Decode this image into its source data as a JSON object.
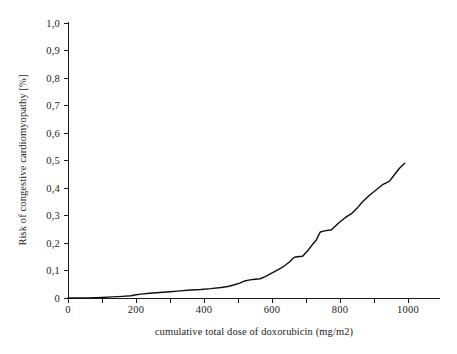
{
  "chart_data": {
    "type": "line",
    "title": "",
    "xlabel": "cumulative total dose of doxorubicin (mg/m2)",
    "ylabel": "Risk of congestive cardiomyopathy [%]",
    "xlim": [
      0,
      1060
    ],
    "ylim": [
      0,
      1.0
    ],
    "grid": false,
    "legend": null,
    "decimal_separator": ",",
    "x_tick_labels": [
      "0",
      "200",
      "400",
      "600",
      "800",
      "1000"
    ],
    "x_tick_values": [
      0,
      200,
      400,
      600,
      800,
      1000
    ],
    "x_minor_tick_values": [
      100,
      300,
      500,
      700,
      900
    ],
    "y_tick_labels": [
      "0",
      "0,1",
      "0,2",
      "0,3",
      "0,4",
      "0,5",
      "0,6",
      "0,7",
      "0,8",
      "0,9",
      "1,0"
    ],
    "y_tick_values": [
      0,
      0.1,
      0.2,
      0.3,
      0.4,
      0.5,
      0.6,
      0.7,
      0.8,
      0.9,
      1.0
    ],
    "series": [
      {
        "name": "Risk of congestive cardiomyopathy",
        "color": "#101010",
        "x": [
          0,
          60,
          100,
          130,
          160,
          185,
          200,
          215,
          240,
          270,
          300,
          330,
          360,
          390,
          420,
          450,
          470,
          490,
          505,
          520,
          535,
          550,
          565,
          580,
          595,
          610,
          625,
          640,
          652,
          660,
          666,
          675,
          690,
          705,
          720,
          730,
          736,
          742,
          755,
          775,
          795,
          815,
          835,
          850,
          865,
          885,
          905,
          925,
          945,
          960,
          975,
          990
        ],
        "y": [
          0.0,
          0.0,
          0.002,
          0.004,
          0.006,
          0.008,
          0.012,
          0.014,
          0.017,
          0.02,
          0.023,
          0.026,
          0.029,
          0.031,
          0.034,
          0.038,
          0.042,
          0.048,
          0.054,
          0.062,
          0.066,
          0.068,
          0.07,
          0.078,
          0.088,
          0.098,
          0.108,
          0.12,
          0.132,
          0.142,
          0.148,
          0.15,
          0.152,
          0.172,
          0.196,
          0.21,
          0.226,
          0.24,
          0.244,
          0.248,
          0.272,
          0.292,
          0.308,
          0.326,
          0.348,
          0.372,
          0.392,
          0.412,
          0.424,
          0.448,
          0.472,
          0.49
        ]
      }
    ]
  }
}
